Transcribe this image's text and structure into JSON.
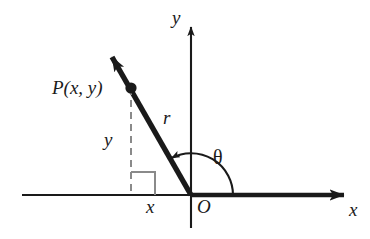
{
  "figure": {
    "type": "geometry-diagram",
    "background_color": "#ffffff",
    "stroke_color": "#1a1a1a",
    "dash_color": "#777777"
  },
  "axes": {
    "x_axis": {
      "label": "x",
      "origin_label": "O",
      "arrow": "right",
      "negative_style": "thin",
      "positive_style": "bold"
    },
    "y_axis": {
      "label": "y",
      "arrow": "up",
      "style": "thin"
    }
  },
  "labels": {
    "point": "P(x, y)",
    "radius": "r",
    "opposite_side": "y",
    "adjacent_side": "x",
    "angle": "θ",
    "origin": "O",
    "axis_x": "x",
    "axis_y": "y"
  },
  "geometry": {
    "origin": {
      "x": 191,
      "y": 195
    },
    "point_P": {
      "x": 131,
      "y": 88
    },
    "ray_tip": {
      "x": 103,
      "y": 48
    },
    "ray_style": "bold-arrow",
    "drop_line_style": "dashed",
    "right_angle_marker": {
      "x": 131,
      "y": 172,
      "width": 24,
      "height": 23
    },
    "angle_arc_radius": 42,
    "angle_arc_direction": "counterclockwise",
    "angle_arc_arrow_at": "terminal-side"
  }
}
